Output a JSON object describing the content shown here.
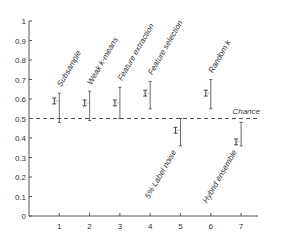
{
  "chart_data": {
    "type": "scatter",
    "title": "",
    "xlabel": "",
    "ylabel": "",
    "xlim": [
      0,
      7.6
    ],
    "ylim": [
      0,
      1
    ],
    "grid": false,
    "x_ticks": [
      "1",
      "2",
      "3",
      "4",
      "5",
      "6",
      "7"
    ],
    "y_ticks": [
      "0",
      "0.1",
      "0.2",
      "0.3",
      "0.4",
      "0.5",
      "0.6",
      "0.7",
      "0.8",
      "0.9",
      "1"
    ],
    "reference_line": {
      "y": 0.5,
      "label": "Chance",
      "style": "dashed"
    },
    "points": [
      {
        "x": 1,
        "label": "Subsample",
        "mean": 0.59,
        "mean_err": 0.015,
        "min": 0.48,
        "max": 0.63
      },
      {
        "x": 2,
        "label": "Weak k-means",
        "mean": 0.58,
        "mean_err": 0.015,
        "min": 0.49,
        "max": 0.64
      },
      {
        "x": 3,
        "label": "Feature extraction",
        "mean": 0.58,
        "mean_err": 0.015,
        "min": 0.5,
        "max": 0.66
      },
      {
        "x": 4,
        "label": "Feature selection",
        "mean": 0.63,
        "mean_err": 0.015,
        "min": 0.55,
        "max": 0.69
      },
      {
        "x": 5,
        "label": "5% Label noise",
        "mean": 0.44,
        "mean_err": 0.015,
        "min": 0.36,
        "max": 0.5
      },
      {
        "x": 6,
        "label": "Random k",
        "mean": 0.63,
        "mean_err": 0.015,
        "min": 0.55,
        "max": 0.7
      },
      {
        "x": 7,
        "label": "Hybrid ensemble",
        "mean": 0.38,
        "mean_err": 0.015,
        "min": 0.36,
        "max": 0.48
      }
    ],
    "label_positions": [
      "above",
      "above",
      "above",
      "above",
      "below",
      "above",
      "below"
    ]
  },
  "colors": {
    "axis": "#555555",
    "marker": "#444444",
    "text": "#333333"
  }
}
